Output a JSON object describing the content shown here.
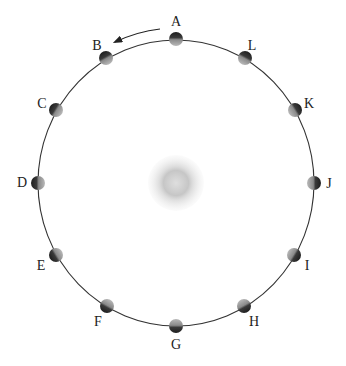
{
  "diagram": {
    "type": "moon-orbit-positions",
    "orbit": {
      "cx": 176,
      "cy": 183,
      "rx": 138,
      "ry": 143,
      "color": "#333333"
    },
    "earth": {
      "cx": 176,
      "cy": 183,
      "r": 28,
      "color": "#bdbdbd"
    },
    "direction_arrow": {
      "meaning": "counterclockwise orbit direction",
      "from": [
        160,
        29
      ],
      "to": [
        115,
        42
      ]
    },
    "moons": [
      {
        "label": "A",
        "x": 176,
        "y": 39,
        "lx": 176,
        "ly": 22
      },
      {
        "label": "B",
        "x": 106,
        "y": 58,
        "lx": 97,
        "ly": 46
      },
      {
        "label": "C",
        "x": 56,
        "y": 110,
        "lx": 42,
        "ly": 104
      },
      {
        "label": "D",
        "x": 38,
        "y": 183,
        "lx": 22,
        "ly": 183
      },
      {
        "label": "E",
        "x": 56,
        "y": 255,
        "lx": 41,
        "ly": 266
      },
      {
        "label": "F",
        "x": 107,
        "y": 306,
        "lx": 98,
        "ly": 322
      },
      {
        "label": "G",
        "x": 176,
        "y": 326,
        "lx": 176,
        "ly": 345
      },
      {
        "label": "H",
        "x": 244,
        "y": 306,
        "lx": 254,
        "ly": 322
      },
      {
        "label": "I",
        "x": 294,
        "y": 255,
        "lx": 307,
        "ly": 266
      },
      {
        "label": "J",
        "x": 314,
        "y": 183,
        "lx": 329,
        "ly": 184
      },
      {
        "label": "K",
        "x": 295,
        "y": 110,
        "lx": 309,
        "ly": 104
      },
      {
        "label": "L",
        "x": 245,
        "y": 58,
        "lx": 252,
        "ly": 46
      }
    ]
  }
}
